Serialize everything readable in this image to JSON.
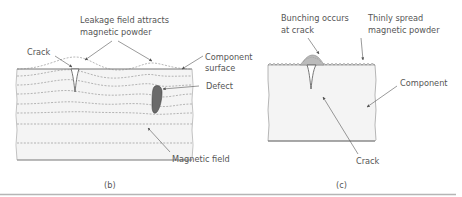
{
  "panel_b": {
    "caption": "(b)",
    "labels": {
      "leakage_line1": "Leakage field attracts",
      "leakage_line2": "magnetic powder",
      "crack": "Crack",
      "component_surface_line1": "Component",
      "component_surface_line2": "surface",
      "defect": "Defect",
      "magnetic_field": "Magnetic field"
    }
  },
  "panel_c": {
    "caption": "(c)",
    "labels": {
      "bunching_line1": "Bunching occurs",
      "bunching_line2": "at crack",
      "thinly_line1": "Thinly spread",
      "thinly_line2": "magnetic powder",
      "component": "Component",
      "crack": "Crack"
    }
  },
  "colors": {
    "outline": "#777777",
    "field_lines": "#888888",
    "component_fill": "#f4f4f4",
    "defect_fill": "#6a6a6a",
    "text": "#555555",
    "rule": "#b5b5b5"
  }
}
